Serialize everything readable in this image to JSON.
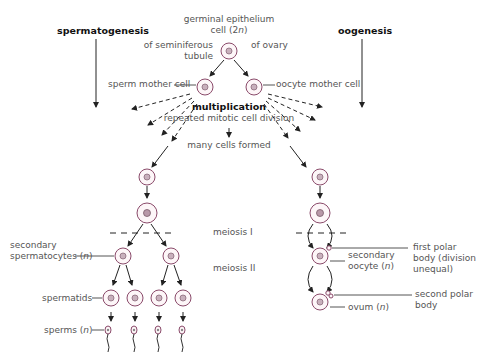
{
  "title_left": "spermatogenesis",
  "title_right": "oogenesis",
  "top_cell": {
    "line1": "germinal epithelium",
    "line2": "cell (2n)"
  },
  "branch_left": {
    "line1": "of seminiferous",
    "line2": "tubule"
  },
  "branch_right": "of ovary",
  "sperm_mother_cell": "sperm mother cell",
  "oocyte_mother_cell": "oocyte mother cell",
  "multiplication": "multiplication",
  "mitotic": "repeated mitotic cell division",
  "many_cells": "many cells formed",
  "meiosis1": "meiosis I",
  "meiosis2": "meiosis II",
  "secondary_spermatocytes": {
    "line1": "secondary",
    "line2": "spermatocytes (n)"
  },
  "spermatids": "spermatids",
  "sperms": "sperms (n)",
  "secondary_oocyte": {
    "line1": "secondary",
    "line2": "oocyte (n)"
  },
  "first_polar_body": {
    "line1": "first polar",
    "line2": "body (division",
    "line3": "unequal)"
  },
  "second_polar_body": {
    "line1": "second polar",
    "line2": "body"
  },
  "ovum": "ovum (n)",
  "colors": {
    "cell_stroke": "#8a4a6a",
    "cell_fill": "#fdf6f8",
    "nucleus": "#9a7a8a",
    "arrow": "#222222"
  }
}
